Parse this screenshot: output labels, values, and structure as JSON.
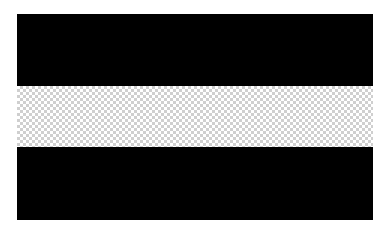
{
  "image": {
    "description": "Horizontal triband flag graphic: black, transparent (checkerboard), black",
    "background_color": "#ffffff"
  },
  "flag": {
    "stripes": [
      {
        "position": "top",
        "fill": "black",
        "color": "#000000"
      },
      {
        "position": "middle",
        "fill": "transparent-checkerboard",
        "color": "#cfcfcf"
      },
      {
        "position": "bottom",
        "fill": "black",
        "color": "#000000"
      }
    ]
  }
}
